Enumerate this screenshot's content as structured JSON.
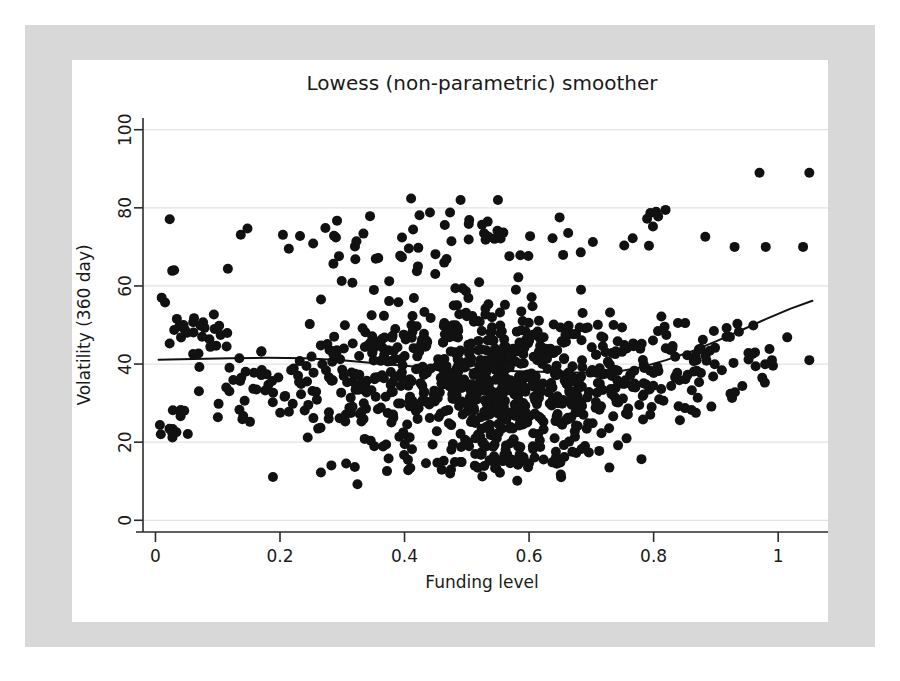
{
  "figure": {
    "background_color": "#ffffff",
    "mount_color": "#d8d8d8",
    "plot_background_color": "#ffffff"
  },
  "chart_data": {
    "type": "scatter",
    "title": "Lowess (non-parametric) smoother",
    "xlabel": "Funding level",
    "ylabel": "Volatility (360 day)",
    "xlim": [
      -0.02,
      1.08
    ],
    "ylim": [
      -3,
      103
    ],
    "xticks": [
      0,
      0.2,
      0.4,
      0.6,
      0.8,
      1
    ],
    "xticklabels": [
      "0",
      "0.2",
      "0.4",
      "0.6",
      "0.8",
      "1"
    ],
    "yticks": [
      0,
      20,
      40,
      60,
      80,
      100
    ],
    "yticklabels": [
      "0",
      "20",
      "40",
      "60",
      "80",
      "100"
    ],
    "grid": true,
    "grid_axis": "y",
    "grid_color": "#e3e3e3",
    "axis_color": "#2b2b2b",
    "legend": false,
    "marker": {
      "shape": "circle",
      "color": "#111111",
      "radius_px": 5
    },
    "series": [
      {
        "name": "observations",
        "type": "scatter",
        "n_points": 980,
        "x_range": [
          0.005,
          1.055
        ],
        "y_range": [
          10,
          89
        ],
        "description": "Dense point cloud concentrated between funding level 0.40 and 0.70 with volatility mostly 20-50; sparse tails at both ends; scattered high band near 68-82 across mid range; isolated outliers near 89.",
        "clusters": [
          {
            "x_center": 0.02,
            "y_center": 22,
            "x_sd": 0.015,
            "y_sd": 1.5,
            "n": 10
          },
          {
            "x_center": 0.02,
            "y_center": 27,
            "x_sd": 0.012,
            "y_sd": 1.0,
            "n": 5
          },
          {
            "x_center": 0.055,
            "y_center": 48,
            "x_sd": 0.03,
            "y_sd": 3.0,
            "n": 26
          },
          {
            "x_center": 0.01,
            "y_center": 57,
            "x_sd": 0.006,
            "y_sd": 1.0,
            "n": 2
          },
          {
            "x_center": 0.03,
            "y_center": 64,
            "x_sd": 0.008,
            "y_sd": 1.0,
            "n": 1
          },
          {
            "x_center": 0.2,
            "y_center": 34,
            "x_sd": 0.07,
            "y_sd": 6.0,
            "n": 60
          },
          {
            "x_center": 0.33,
            "y_center": 36,
            "x_sd": 0.06,
            "y_sd": 8.0,
            "n": 85
          },
          {
            "x_center": 0.47,
            "y_center": 37,
            "x_sd": 0.07,
            "y_sd": 9.5,
            "n": 230
          },
          {
            "x_center": 0.56,
            "y_center": 35,
            "x_sd": 0.07,
            "y_sd": 10.0,
            "n": 250
          },
          {
            "x_center": 0.66,
            "y_center": 36,
            "x_sd": 0.06,
            "y_sd": 9.0,
            "n": 150
          },
          {
            "x_center": 0.76,
            "y_center": 36,
            "x_sd": 0.05,
            "y_sd": 8.0,
            "n": 70
          },
          {
            "x_center": 0.86,
            "y_center": 40,
            "x_sd": 0.04,
            "y_sd": 6.5,
            "n": 45
          },
          {
            "x_center": 0.95,
            "y_center": 43,
            "x_sd": 0.04,
            "y_sd": 5.0,
            "n": 18
          },
          {
            "x_center": 0.48,
            "y_center": 72,
            "x_sd": 0.18,
            "y_sd": 4.0,
            "n": 70
          },
          {
            "x_center": 0.52,
            "y_center": 15,
            "x_sd": 0.1,
            "y_sd": 2.5,
            "n": 55
          }
        ],
        "notable_points": [
          {
            "x": 0.97,
            "y": 89
          },
          {
            "x": 1.05,
            "y": 89
          },
          {
            "x": 0.93,
            "y": 70
          },
          {
            "x": 0.98,
            "y": 70
          },
          {
            "x": 1.04,
            "y": 70
          },
          {
            "x": 0.49,
            "y": 82
          },
          {
            "x": 0.55,
            "y": 82
          },
          {
            "x": 0.03,
            "y": 64
          },
          {
            "x": 0.01,
            "y": 57
          },
          {
            "x": 1.05,
            "y": 41
          },
          {
            "x": 0.99,
            "y": 41
          }
        ]
      },
      {
        "name": "lowess smoother",
        "type": "line",
        "color": "#111111",
        "width_px": 2,
        "x": [
          0.005,
          0.06,
          0.12,
          0.18,
          0.24,
          0.3,
          0.34,
          0.38,
          0.42,
          0.46,
          0.5,
          0.55,
          0.6,
          0.65,
          0.7,
          0.74,
          0.78,
          0.82,
          0.86,
          0.9,
          0.94,
          0.98,
          1.02,
          1.055
        ],
        "y": [
          41.1,
          41.3,
          41.5,
          41.6,
          41.5,
          41.0,
          40.4,
          39.8,
          39.3,
          38.9,
          38.6,
          38.3,
          38.1,
          37.9,
          37.8,
          38.0,
          39.2,
          41.0,
          43.2,
          45.8,
          48.6,
          51.5,
          54.2,
          56.2
        ]
      }
    ]
  }
}
